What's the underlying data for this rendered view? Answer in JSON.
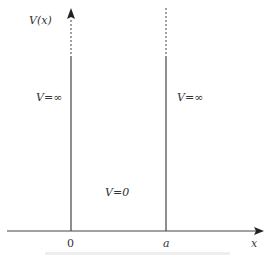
{
  "diagram": {
    "type": "infinite-square-well",
    "y_axis_label": "V(x)",
    "x_axis_label": "x",
    "x_ticks": [
      "0",
      "a"
    ],
    "regions": [
      {
        "name": "left",
        "label": "V=∞"
      },
      {
        "name": "inside",
        "label": "V=0"
      },
      {
        "name": "right",
        "label": "V=∞"
      }
    ],
    "colors": {
      "line": "#333333",
      "background": "#ffffff"
    }
  }
}
